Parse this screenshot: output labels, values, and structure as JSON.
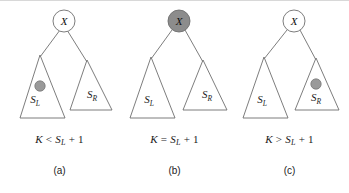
{
  "figure": {
    "background_color": "#ffffff",
    "stroke_color": "#6e6e6e",
    "marker_fill": "#9a9a9a",
    "node_fill_empty": "#ffffff",
    "node_fill_highlight": "#8c8c8c",
    "panel_count": 3
  },
  "panels": [
    {
      "id": "a",
      "label": "(a)",
      "root": {
        "text": "X",
        "fill": "#ffffff",
        "highlighted": false,
        "name": "root-node"
      },
      "left_subtree": {
        "label": "S",
        "sub": "L",
        "name": "left-subtree-triangle",
        "has_marker": true
      },
      "right_subtree": {
        "label": "S",
        "sub": "R",
        "name": "right-subtree-triangle",
        "has_marker": false
      },
      "marker": {
        "location": "left-subtree",
        "fill": "#9a9a9a",
        "name": "target-marker"
      },
      "condition": {
        "lhs": "K",
        "operator": "<",
        "rhs_base": "S",
        "rhs_sub": "L",
        "rhs_tail": "+ 1",
        "full": "K < S_L + 1"
      }
    },
    {
      "id": "b",
      "label": "(b)",
      "root": {
        "text": "X",
        "fill": "#8c8c8c",
        "highlighted": true,
        "name": "root-node"
      },
      "left_subtree": {
        "label": "S",
        "sub": "L",
        "name": "left-subtree-triangle",
        "has_marker": false
      },
      "right_subtree": {
        "label": "S",
        "sub": "R",
        "name": "right-subtree-triangle",
        "has_marker": false
      },
      "marker": {
        "location": "root",
        "fill": "#8c8c8c",
        "name": "target-marker"
      },
      "condition": {
        "lhs": "K",
        "operator": "=",
        "rhs_base": "S",
        "rhs_sub": "L",
        "rhs_tail": "+ 1",
        "full": "K = S_L + 1"
      }
    },
    {
      "id": "c",
      "label": "(c)",
      "root": {
        "text": "X",
        "fill": "#ffffff",
        "highlighted": false,
        "name": "root-node"
      },
      "left_subtree": {
        "label": "S",
        "sub": "L",
        "name": "left-subtree-triangle",
        "has_marker": false
      },
      "right_subtree": {
        "label": "S",
        "sub": "R",
        "name": "right-subtree-triangle",
        "has_marker": true
      },
      "marker": {
        "location": "right-subtree",
        "fill": "#9a9a9a",
        "name": "target-marker"
      },
      "condition": {
        "lhs": "K",
        "operator": ">",
        "rhs_base": "S",
        "rhs_sub": "L",
        "rhs_tail": "+ 1",
        "full": "K > S_L + 1"
      }
    }
  ]
}
